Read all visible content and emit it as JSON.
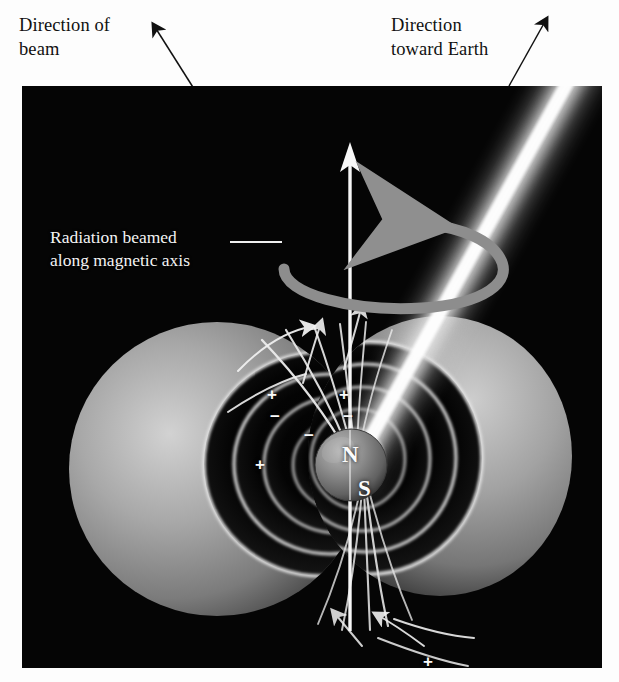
{
  "figure": {
    "panel_background": "#050505",
    "page_background": "#ffffff"
  },
  "captions": {
    "beam": "Direction of\nbeam",
    "earth": "Direction\ntoward Earth",
    "radiation": "Radiation beamed\nalong magnetic axis"
  },
  "star": {
    "north_label": "N",
    "south_label": "S",
    "sphere_color": "#8d8d8d"
  },
  "axes": {
    "rotation_axis_name": "rotation-axis-arrow",
    "rotation_direction_name": "rotation-direction-arrow",
    "magnetic_axis_name": "magnetic-axis-beam"
  },
  "charges": {
    "upper": [
      {
        "sign": "+",
        "x": 245,
        "y": 300
      },
      {
        "sign": "−",
        "x": 248,
        "y": 322
      },
      {
        "sign": "+",
        "x": 233,
        "y": 370
      },
      {
        "sign": "+",
        "x": 317,
        "y": 300
      },
      {
        "sign": "−",
        "x": 321,
        "y": 322
      },
      {
        "sign": "−",
        "x": 282,
        "y": 341
      }
    ],
    "lower": [
      {
        "sign": "−",
        "x": 360,
        "y": 578
      },
      {
        "sign": "+",
        "x": 401,
        "y": 567
      },
      {
        "sign": "−",
        "x": 354,
        "y": 604
      },
      {
        "sign": "+",
        "x": 397,
        "y": 600
      }
    ]
  },
  "colors": {
    "beam_core": "#ffffff",
    "beam_glow": "#b9b9b9",
    "magnetosphere": "#9a9a9a",
    "field_line": "#e8e8e8",
    "rotation_arrow": "#8a8a8a",
    "caption_dark": "#111111",
    "caption_light": "#f4f4f4"
  }
}
